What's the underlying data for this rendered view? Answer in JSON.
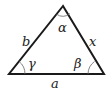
{
  "diagram": {
    "title": "",
    "type": "triangle",
    "vertices": {
      "apex": [
        63,
        6
      ],
      "bottom_left": [
        9,
        74
      ],
      "bottom_right": [
        104,
        74
      ]
    },
    "sides": [
      {
        "id": "left",
        "label": "b"
      },
      {
        "id": "right",
        "label": "x"
      },
      {
        "id": "bottom",
        "label": "a"
      }
    ],
    "angles": [
      {
        "id": "apex",
        "label": "α"
      },
      {
        "id": "bottom_left",
        "label": "γ"
      },
      {
        "id": "bottom_right",
        "label": "β"
      }
    ],
    "colors": {
      "stroke": "#1a1a1a",
      "arc": "#555555",
      "text": "#222222",
      "background": "#ffffff"
    }
  }
}
